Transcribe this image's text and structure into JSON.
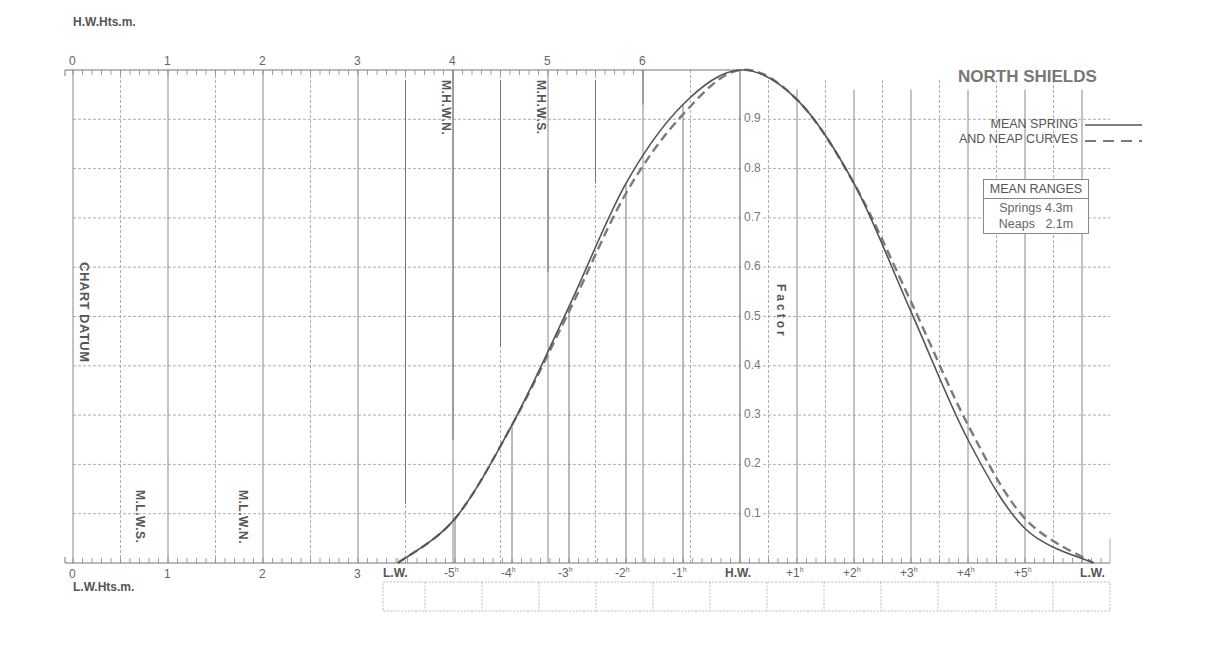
{
  "title": "NORTH SHIELDS",
  "legend": {
    "line1": "MEAN SPRING",
    "line2": "AND NEAP CURVES",
    "spring_style": "solid",
    "neap_style": "dashed"
  },
  "mean_ranges": {
    "header": "MEAN RANGES",
    "springs_label": "Springs",
    "springs_value": "4.3m",
    "neaps_label": "Neaps",
    "neaps_value": "2.1m"
  },
  "axes": {
    "top_title": "H.W.Hts.m.",
    "bottom_title": "L.W.Hts.m.",
    "top_ticks": [
      "0",
      "1",
      "2",
      "3",
      "4",
      "5",
      "6"
    ],
    "bottom_ticks": [
      "0",
      "1",
      "2",
      "3"
    ],
    "factor_title": "Factor",
    "factor_ticks": [
      "0.1",
      "0.2",
      "0.3",
      "0.4",
      "0.5",
      "0.6",
      "0.7",
      "0.8",
      "0.9"
    ],
    "time_ticks": [
      "L.W.",
      "-5h",
      "-4h",
      "-3h",
      "-2h",
      "-1h",
      "H.W.",
      "+1h",
      "+2h",
      "+3h",
      "+4h",
      "+5h",
      "L.W."
    ]
  },
  "reference_labels": {
    "chart_datum": "CHART DATUM",
    "mhwn": "M.H.W.N.",
    "mhws": "M.H.W.S.",
    "mlws": "M.L.W.S.",
    "mlwn": "M.L.W.N."
  },
  "colors": {
    "grid": "#9a9a9a",
    "axis": "#777777",
    "spring_curve": "#555555",
    "neap_curve": "#7a7a7a"
  },
  "chart_data": {
    "type": "line",
    "title": "NORTH SHIELDS",
    "xlabel": "Time relative to High Water (hours)",
    "ylabel": "Factor",
    "ylim": [
      0,
      1
    ],
    "grid": true,
    "legend_position": "top-right",
    "x": [
      -6,
      -5,
      -4,
      -3,
      -2,
      -1,
      0,
      1,
      2,
      3,
      4,
      5,
      6.2
    ],
    "x_labels": [
      "L.W.",
      "-5h",
      "-4h",
      "-3h",
      "-2h",
      "-1h",
      "H.W.",
      "+1h",
      "+2h",
      "+3h",
      "+4h",
      "+5h",
      "L.W."
    ],
    "series": [
      {
        "name": "Mean Spring",
        "style": "solid",
        "values": [
          0.0,
          0.09,
          0.28,
          0.52,
          0.77,
          0.93,
          1.0,
          0.94,
          0.77,
          0.51,
          0.25,
          0.07,
          0.0
        ]
      },
      {
        "name": "Mean Neap",
        "style": "dashed",
        "values": [
          0.0,
          0.09,
          0.28,
          0.51,
          0.75,
          0.91,
          1.0,
          0.94,
          0.77,
          0.53,
          0.28,
          0.09,
          0.0
        ]
      }
    ],
    "height_scales": {
      "hw_heights_m": {
        "label": "H.W.Hts.m.",
        "range": [
          0,
          6
        ],
        "ticks": [
          0,
          1,
          2,
          3,
          4,
          5,
          6
        ]
      },
      "lw_heights_m": {
        "label": "L.W.Hts.m.",
        "range": [
          0,
          3
        ],
        "ticks": [
          0,
          1,
          2,
          3
        ]
      }
    },
    "reference_levels_m": {
      "MHWN": 4.0,
      "MHWS": 5.0,
      "MLWS": 0.7,
      "MLWN": 1.8
    },
    "mean_ranges_m": {
      "springs": 4.3,
      "neaps": 2.1
    }
  }
}
